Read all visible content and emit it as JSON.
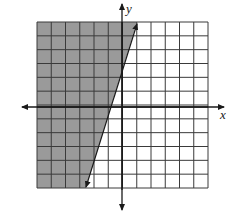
{
  "chart_data": {
    "type": "inequality-graph",
    "title": "",
    "xlabel": "x",
    "ylabel": "y",
    "grid": true,
    "xlim": [
      -6,
      6
    ],
    "ylim": [
      -6,
      6
    ],
    "grid_step": 1,
    "boundary_line": {
      "style": "solid",
      "points": [
        [
          -2.5,
          -6
        ],
        [
          1,
          6
        ]
      ],
      "arrows": "both"
    },
    "shaded_region": "left of boundary line",
    "colors": {
      "shade": "#9a9a9a",
      "grid": "#3a3a3a",
      "axis": "#1a1a1a",
      "background": "#ffffff"
    }
  },
  "labels": {
    "x_axis": "x",
    "y_axis": "y"
  }
}
